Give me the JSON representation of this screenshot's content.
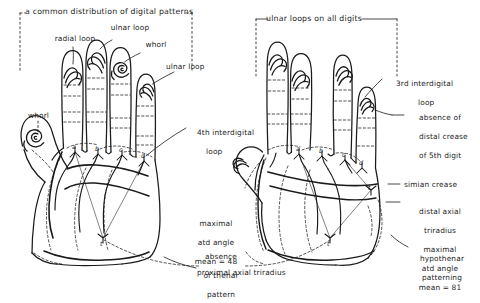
{
  "figure": {
    "type": "dermatoglyphics-hand-diagram",
    "background": "#ffffff",
    "ink": "#1a1a1a",
    "panels": [
      {
        "id": "left-hand",
        "side": "left",
        "bracket_title": "a common distribution of digital patterns",
        "digit_patterns": [
          {
            "digit": "thumb",
            "pattern": "whorl"
          },
          {
            "digit": "index",
            "pattern": "radial loop"
          },
          {
            "digit": "middle",
            "pattern": "ulnar loop"
          },
          {
            "digit": "ring",
            "pattern": "whorl"
          },
          {
            "digit": "little",
            "pattern": "ulnar loop"
          }
        ],
        "triradii": [
          "a",
          "b",
          "c",
          "d",
          "t"
        ],
        "labels": [
          "whorl",
          "radial loop",
          "ulnar loop",
          "whorl",
          "ulnar loop",
          "4th interdigital\nloop",
          "maximal\natd angle\nmean = 48",
          "absence\nof thenar\npattern",
          "proximal axial triradius"
        ]
      },
      {
        "id": "right-hand",
        "side": "right",
        "bracket_title": "ulnar loops on all digits",
        "digit_patterns": [
          {
            "digit": "thumb",
            "pattern": "ulnar loop"
          },
          {
            "digit": "index",
            "pattern": "ulnar loop"
          },
          {
            "digit": "middle",
            "pattern": "ulnar loop"
          },
          {
            "digit": "ring",
            "pattern": "ulnar loop"
          },
          {
            "digit": "little",
            "pattern": "ulnar loop"
          }
        ],
        "triradii": [
          "a",
          "b",
          "c",
          "d",
          "t"
        ],
        "labels": [
          "3rd interdigital\nloop",
          "absence of\ndistal crease\nof 5th digit",
          "simian crease",
          "distal axial\ntriradius\nmaximal\natd angle\nmean = 81",
          "hypothenar\npatterning",
          "absence\nof thenar\npattern"
        ]
      }
    ]
  },
  "left": {
    "title": "a common distribution of digital patterns",
    "whorl_thumb": "whorl",
    "radial_loop": "radial loop",
    "ulnar_loop_middle": "ulnar loop",
    "whorl_ring": "whorl",
    "ulnar_loop_little": "ulnar loop",
    "interdigital": "4th interdigital",
    "interdigital_2": "loop",
    "atd_1": "maximal",
    "atd_2": "atd angle",
    "atd_3": "mean = 48",
    "thenar_1": "absence",
    "thenar_2": "of thenar",
    "thenar_3": "pattern",
    "axial": "proximal axial triradius",
    "tri_a": "a",
    "tri_b": "b",
    "tri_c": "c",
    "tri_d": "d",
    "tri_t": "t"
  },
  "right": {
    "title": "ulnar loops on all digits",
    "interdigital_1": "3rd interdigital",
    "interdigital_2": "loop",
    "crease_1": "absence of",
    "crease_2": "distal crease",
    "crease_3": "of 5th digit",
    "simian": "simian crease",
    "axial_1": "distal axial",
    "axial_2": "triradius",
    "atd_1": "maximal",
    "atd_2": "atd angle",
    "atd_3": "mean = 81",
    "hypo_1": "hypothenar",
    "hypo_2": "patterning",
    "tri_a": "a",
    "tri_b": "b",
    "tri_c": "c",
    "tri_d": "d",
    "tri_t": "t"
  }
}
